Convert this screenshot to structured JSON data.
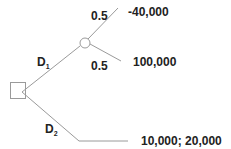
{
  "diagram": {
    "type": "decision-tree",
    "decision_node": {
      "shape": "square"
    },
    "chance_node": {
      "shape": "circle"
    },
    "branches": [
      {
        "label": "D",
        "subscript": "1",
        "leads_to": "chance_node"
      },
      {
        "label": "D",
        "subscript": "2",
        "leads_to": "terminal"
      }
    ],
    "chance_outcomes": [
      {
        "probability": "0.5",
        "payoff": "-40,000"
      },
      {
        "probability": "0.5",
        "payoff": "100,000"
      }
    ],
    "d2_payoff": "10,000; 20,000"
  }
}
